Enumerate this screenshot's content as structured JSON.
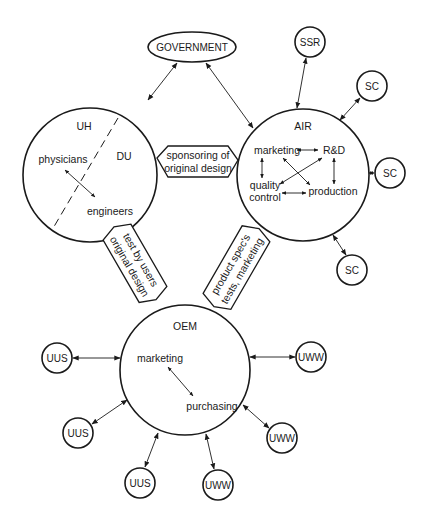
{
  "diagram": {
    "government": {
      "label": "GOVERNMENT"
    },
    "uh_du": {
      "left_label": "UH",
      "right_label": "DU",
      "members": [
        "physicians",
        "engineers"
      ]
    },
    "air": {
      "label": "AIR",
      "departments": [
        "marketing",
        "R&D",
        "quality",
        "control",
        "production"
      ]
    },
    "oem": {
      "label": "OEM",
      "departments": [
        "marketing",
        "purchasing"
      ]
    },
    "connectors": {
      "sponsoring": [
        "sponsoring of",
        "original design"
      ],
      "test_by_users": [
        "test by users",
        "original design"
      ],
      "product_spec": [
        "product spec's",
        "tests, marketing"
      ]
    },
    "satellites": {
      "ssr": "SSR",
      "sc": [
        "SC",
        "SC",
        "SC"
      ],
      "uus": [
        "UUS",
        "UUS",
        "UUS"
      ],
      "uww": [
        "UWW",
        "UWW",
        "UWW"
      ]
    }
  }
}
